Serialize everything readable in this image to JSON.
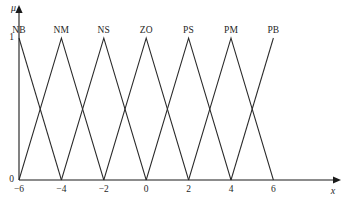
{
  "figure": {
    "background_color": "#ffffff",
    "line_color": "#2a2a2a",
    "axis_color": "#1a1a1a"
  },
  "axes": {
    "y_axis_name": "μ",
    "x_axis_name": "x",
    "y_ticks": [
      "1",
      "0"
    ],
    "x_ticks": [
      "−6",
      "−4",
      "−2",
      "0",
      "2",
      "4",
      "6"
    ]
  },
  "chart_data": {
    "type": "line",
    "title": "",
    "subtitle": "",
    "xlabel": "x",
    "ylabel": "μ",
    "xlim": [
      -6,
      7.4
    ],
    "ylim": [
      0,
      1.12
    ],
    "xticks": [
      -6,
      -4,
      -2,
      0,
      2,
      4,
      6
    ],
    "xticklabels": [
      "−6",
      "−4",
      "−2",
      "0",
      "2",
      "4",
      "6"
    ],
    "yticks": [
      0,
      1
    ],
    "yticklabels": [
      "0",
      "1"
    ],
    "grid": false,
    "legend": "none",
    "annotations": [
      {
        "text": "NB",
        "x": -6,
        "y": 1.12
      },
      {
        "text": "NM",
        "x": -4,
        "y": 1.12
      },
      {
        "text": "NS",
        "x": -2,
        "y": 1.12
      },
      {
        "text": "ZO",
        "x": 0,
        "y": 1.12
      },
      {
        "text": "PS",
        "x": 2,
        "y": 1.12
      },
      {
        "text": "PM",
        "x": 4,
        "y": 1.12
      },
      {
        "text": "PB",
        "x": 6,
        "y": 1.12
      }
    ],
    "series": [
      {
        "name": "NB",
        "x": [
          -6,
          -4
        ],
        "values": [
          1,
          0
        ]
      },
      {
        "name": "NM",
        "x": [
          -6,
          -4,
          -2
        ],
        "values": [
          0,
          1,
          0
        ]
      },
      {
        "name": "NS",
        "x": [
          -4,
          -2,
          0
        ],
        "values": [
          0,
          1,
          0
        ]
      },
      {
        "name": "ZO",
        "x": [
          -2,
          0,
          2
        ],
        "values": [
          0,
          1,
          0
        ]
      },
      {
        "name": "PS",
        "x": [
          0,
          2,
          4
        ],
        "values": [
          0,
          1,
          0
        ]
      },
      {
        "name": "PM",
        "x": [
          2,
          4,
          6
        ],
        "values": [
          0,
          1,
          0
        ]
      },
      {
        "name": "PB",
        "x": [
          4,
          6
        ],
        "values": [
          0,
          1
        ]
      }
    ]
  },
  "geometry": {
    "origin_x": 19,
    "baseline_y": 180,
    "peak_y": 38,
    "unit_px": 21.2,
    "x_axis_end": 337,
    "y_axis_top": 10,
    "label_y": 26
  }
}
